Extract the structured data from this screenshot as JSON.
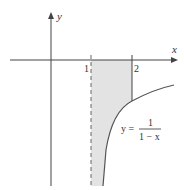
{
  "figure": {
    "y_axis_label": "y",
    "x_axis_label": "x",
    "tick_1": "1",
    "tick_2": "2",
    "equation_lhs": "y =",
    "equation_num": "1",
    "equation_den": "1 − x"
  },
  "colors": {
    "shade": "#e3e3e3",
    "axis": "#444444",
    "curve": "#555555"
  }
}
